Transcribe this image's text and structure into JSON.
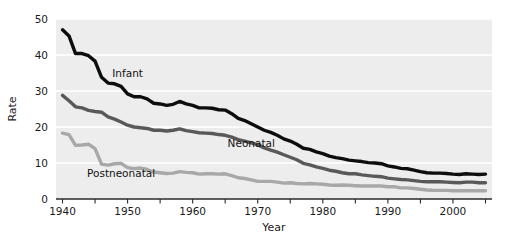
{
  "chart_data": {
    "type": "line",
    "title": "",
    "xlabel": "Year",
    "ylabel": "Rate",
    "xlim": [
      1939,
      2006
    ],
    "ylim": [
      0,
      50
    ],
    "grid": true,
    "legend_position": "inline-annotations",
    "xticks": [
      1940,
      1945,
      1950,
      1955,
      1960,
      1965,
      1970,
      1975,
      1980,
      1985,
      1990,
      1995,
      2000,
      2005
    ],
    "xtick_labels_shown": [
      "1940",
      "1950",
      "1960",
      "1970",
      "1980",
      "1990",
      "2000"
    ],
    "yticks": [
      0,
      10,
      20,
      30,
      40,
      50
    ],
    "ytick_labels": [
      "0",
      "10",
      "20",
      "30",
      "40",
      "50"
    ],
    "x": [
      1940,
      1941,
      1942,
      1943,
      1944,
      1945,
      1946,
      1947,
      1948,
      1949,
      1950,
      1951,
      1952,
      1953,
      1954,
      1955,
      1956,
      1957,
      1958,
      1959,
      1960,
      1961,
      1962,
      1963,
      1964,
      1965,
      1966,
      1967,
      1968,
      1969,
      1970,
      1971,
      1972,
      1973,
      1974,
      1975,
      1976,
      1977,
      1978,
      1979,
      1980,
      1981,
      1982,
      1983,
      1984,
      1985,
      1986,
      1987,
      1988,
      1989,
      1990,
      1991,
      1992,
      1993,
      1994,
      1995,
      1996,
      1997,
      1998,
      1999,
      2000,
      2001,
      2002,
      2003,
      2004,
      2005
    ],
    "series": [
      {
        "name": "Infant",
        "color": "#0d0d0d",
        "label_x": 1950,
        "label_y": 34,
        "values": [
          47.0,
          45.3,
          40.4,
          40.4,
          39.8,
          38.3,
          33.8,
          32.2,
          32.0,
          31.3,
          29.2,
          28.4,
          28.4,
          27.8,
          26.6,
          26.4,
          26.0,
          26.3,
          27.1,
          26.4,
          26.0,
          25.3,
          25.3,
          25.2,
          24.8,
          24.7,
          23.7,
          22.4,
          21.8,
          20.9,
          20.0,
          19.1,
          18.5,
          17.7,
          16.7,
          16.1,
          15.2,
          14.1,
          13.8,
          13.1,
          12.6,
          11.9,
          11.5,
          11.2,
          10.8,
          10.6,
          10.4,
          10.1,
          10.0,
          9.8,
          9.2,
          8.9,
          8.5,
          8.4,
          8.0,
          7.6,
          7.3,
          7.2,
          7.2,
          7.1,
          6.9,
          6.8,
          7.0,
          6.9,
          6.8,
          6.9
        ]
      },
      {
        "name": "Neonatal",
        "color": "#595959",
        "label_x": 1969,
        "label_y": 14.5,
        "values": [
          28.8,
          27.3,
          25.6,
          25.3,
          24.6,
          24.3,
          24.1,
          22.8,
          22.2,
          21.4,
          20.5,
          20.0,
          19.8,
          19.6,
          19.1,
          19.1,
          18.9,
          19.1,
          19.5,
          19.0,
          18.7,
          18.4,
          18.3,
          18.2,
          17.9,
          17.7,
          17.2,
          16.5,
          16.1,
          15.6,
          15.1,
          14.2,
          13.6,
          13.0,
          12.3,
          11.6,
          10.9,
          9.9,
          9.5,
          8.9,
          8.5,
          8.0,
          7.7,
          7.3,
          7.0,
          7.0,
          6.7,
          6.5,
          6.3,
          6.2,
          5.8,
          5.6,
          5.4,
          5.3,
          5.1,
          4.9,
          4.8,
          4.8,
          4.8,
          4.7,
          4.6,
          4.5,
          4.7,
          4.7,
          4.5,
          4.5
        ]
      },
      {
        "name": "Postneonatal",
        "color": "#a8a8a8",
        "label_x": 1949,
        "label_y": 6.0,
        "values": [
          18.3,
          17.9,
          14.9,
          15.0,
          15.2,
          14.0,
          9.7,
          9.4,
          9.8,
          9.9,
          8.7,
          8.4,
          8.6,
          8.2,
          7.5,
          7.3,
          7.1,
          7.2,
          7.6,
          7.4,
          7.3,
          6.9,
          7.0,
          7.0,
          6.9,
          7.0,
          6.5,
          5.9,
          5.7,
          5.3,
          4.9,
          4.9,
          4.9,
          4.7,
          4.4,
          4.5,
          4.3,
          4.2,
          4.3,
          4.2,
          4.1,
          3.9,
          3.8,
          3.9,
          3.8,
          3.7,
          3.6,
          3.6,
          3.6,
          3.6,
          3.4,
          3.4,
          3.1,
          3.1,
          2.9,
          2.7,
          2.5,
          2.4,
          2.4,
          2.4,
          2.3,
          2.3,
          2.3,
          2.3,
          2.3,
          2.3
        ]
      }
    ]
  },
  "axes": {
    "y_title": "Rate",
    "x_title": "Year"
  },
  "colors": {
    "plot_background": "#ededed",
    "gridline": "#ffffff",
    "axis_line": "#2b2b2b",
    "text": "#1a1a1a"
  }
}
